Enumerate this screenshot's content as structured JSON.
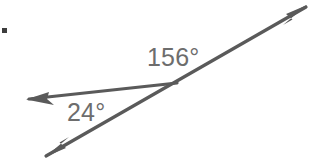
{
  "figure": {
    "background_color": "#ffffff",
    "stroke_color": "#5a5a5a",
    "text_color": "#6d6d6d",
    "bullet_color": "#3d3d3d",
    "bullet": {
      "name": "bullet-mark",
      "x": 2,
      "y": 28,
      "size": 5
    },
    "labels": [
      {
        "id": "label-156",
        "text": "156°",
        "value": 156,
        "unit": "degrees",
        "x": 147,
        "y": 45,
        "font_size": 25
      },
      {
        "id": "label-24",
        "text": "24°",
        "value": 24,
        "unit": "degrees",
        "x": 67,
        "y": 100,
        "font_size": 25
      }
    ],
    "vertex": {
      "x": 177,
      "y": 83
    },
    "rays": [
      {
        "id": "ray-upper-right",
        "from": {
          "x": 177,
          "y": 83
        },
        "to": {
          "x": 306,
          "y": 7
        },
        "arrowhead": "at-end"
      },
      {
        "id": "ray-lower-left",
        "from": {
          "x": 177,
          "y": 83
        },
        "to": {
          "x": 46,
          "y": 156
        },
        "arrowhead": "at-end"
      },
      {
        "id": "ray-left",
        "from": {
          "x": 177,
          "y": 83
        },
        "to": {
          "x": 28,
          "y": 99
        },
        "arrowhead": "at-end"
      }
    ]
  }
}
